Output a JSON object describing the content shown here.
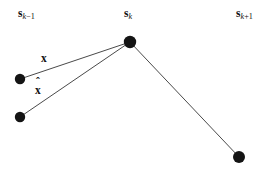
{
  "figure": {
    "background_color": "#ffffff",
    "ink_color": "#111111",
    "line_color": "#4a4a4a",
    "node_color": "#141414",
    "width": 278,
    "height": 170,
    "caption_free": true
  },
  "node_labels": [
    {
      "id": "s-k-minus-1",
      "symbol": "s",
      "subscript_var": "k",
      "subscript_op": "−1",
      "x": 18,
      "y": 8
    },
    {
      "id": "s-k",
      "symbol": "s",
      "subscript_var": "k",
      "subscript_op": "",
      "x": 124,
      "y": 8
    },
    {
      "id": "s-k-plus-1",
      "symbol": "s",
      "subscript_var": "k",
      "subscript_op": "+1",
      "x": 236,
      "y": 8
    }
  ],
  "vector_labels": [
    {
      "id": "x-measured",
      "text": "x",
      "hat": false,
      "x": 41,
      "y": 53
    },
    {
      "id": "x-hat-estimated",
      "text": "x",
      "hat": true,
      "hat_glyph": "ˆ",
      "x": 35,
      "y": 85
    }
  ],
  "nodes": [
    {
      "id": "node-upper-left",
      "cx": 20,
      "cy": 79,
      "r": 5.2
    },
    {
      "id": "node-lower-left",
      "cx": 20,
      "cy": 117,
      "r": 5.2
    },
    {
      "id": "node-center-top",
      "cx": 130,
      "cy": 42,
      "r": 6.2
    },
    {
      "id": "node-lower-right",
      "cx": 239,
      "cy": 157,
      "r": 6.0
    }
  ],
  "edges": [
    {
      "id": "edge-x",
      "from": "node-upper-left",
      "to": "node-center-top",
      "x1": 20,
      "y1": 79,
      "x2": 130,
      "y2": 42
    },
    {
      "id": "edge-x-hat",
      "from": "node-lower-left",
      "to": "node-center-top",
      "x1": 20,
      "y1": 117,
      "x2": 130,
      "y2": 42
    },
    {
      "id": "edge-next",
      "from": "node-center-top",
      "to": "node-lower-right",
      "x1": 130,
      "y1": 42,
      "x2": 239,
      "y2": 157
    }
  ]
}
